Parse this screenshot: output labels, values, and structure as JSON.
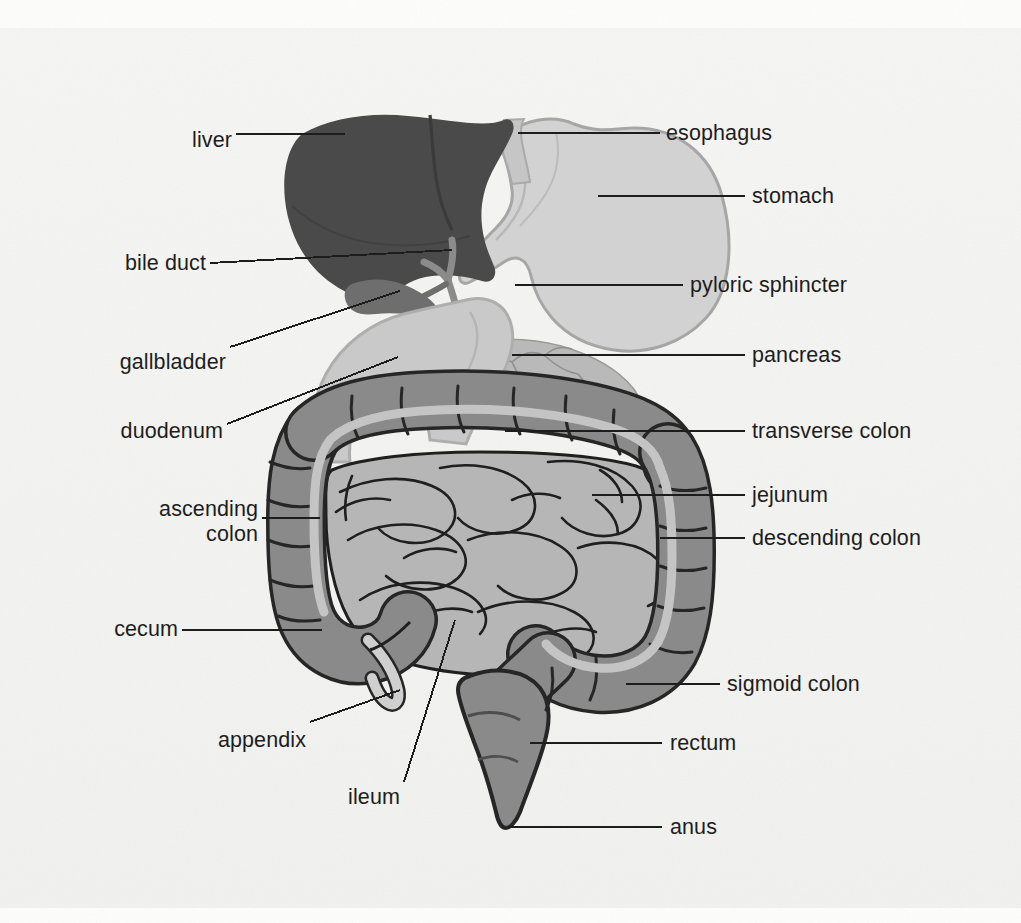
{
  "figure": {
    "kind": "labeled-anatomical-diagram",
    "background_color": "#f2f2f0"
  },
  "palette": {
    "liver": "#4a4a4a",
    "gallbladder": "#6e6e6e",
    "stomach": "#d2d2d2",
    "stomach_outline": "#a6a6a6",
    "duodenum": "#c9c9c9",
    "pancreas": "#b9b9b9",
    "colon": "#8a8a8a",
    "colon_stripe": "#c4c4c4",
    "colon_outline": "#262626",
    "small_intestine": "#b6b6b6",
    "small_intestine_outline": "#1f1f1f",
    "appendix": "#cfcfcf",
    "leader_line": "#1d1d1d",
    "text": "#1d1d1d"
  },
  "labels": {
    "left": [
      {
        "id": "liver",
        "text": "liver",
        "x": 172,
        "y": 128,
        "align": "right"
      },
      {
        "id": "bile-duct",
        "text": "bile duct",
        "x": 100,
        "y": 251,
        "align": "right"
      },
      {
        "id": "gallbladder",
        "text": "gallbladder",
        "x": 100,
        "y": 350,
        "align": "right"
      },
      {
        "id": "duodenum",
        "text": "duodenum",
        "x": 100,
        "y": 419,
        "align": "right"
      },
      {
        "id": "ascending-colon",
        "text": "ascending\ncolon",
        "x": 106,
        "y": 497,
        "align": "right"
      },
      {
        "id": "cecum",
        "text": "cecum",
        "x": 103,
        "y": 617,
        "align": "right"
      },
      {
        "id": "appendix",
        "text": "appendix",
        "x": 200,
        "y": 728,
        "align": "right"
      },
      {
        "id": "ileum",
        "text": "ileum",
        "x": 348,
        "y": 785,
        "align": "right"
      }
    ],
    "right": [
      {
        "id": "esophagus",
        "text": "esophagus",
        "x": 666,
        "y": 124,
        "align": "left"
      },
      {
        "id": "stomach",
        "text": "stomach",
        "x": 752,
        "y": 182,
        "align": "left"
      },
      {
        "id": "pyloric-sphincter",
        "text": "pyloric sphincter",
        "x": 690,
        "y": 271,
        "align": "left"
      },
      {
        "id": "pancreas",
        "text": "pancreas",
        "x": 752,
        "y": 337,
        "align": "left"
      },
      {
        "id": "transverse-colon",
        "text": "transverse colon",
        "x": 752,
        "y": 417,
        "align": "left"
      },
      {
        "id": "jejunum",
        "text": "jejunum",
        "x": 752,
        "y": 481,
        "align": "left"
      },
      {
        "id": "descending-colon",
        "text": "descending colon",
        "x": 752,
        "y": 524,
        "align": "left"
      },
      {
        "id": "sigmoid-colon",
        "text": "sigmoid colon",
        "x": 727,
        "y": 671,
        "align": "left"
      },
      {
        "id": "rectum",
        "text": "rectum",
        "x": 670,
        "y": 729,
        "align": "left"
      },
      {
        "id": "anus",
        "text": "anus",
        "x": 670,
        "y": 812,
        "align": "left"
      }
    ]
  },
  "organs": [
    {
      "id": "liver",
      "name": "liver"
    },
    {
      "id": "gallbladder",
      "name": "gallbladder"
    },
    {
      "id": "bile-duct",
      "name": "bile duct"
    },
    {
      "id": "esophagus",
      "name": "esophagus"
    },
    {
      "id": "stomach",
      "name": "stomach"
    },
    {
      "id": "pyloric-sphincter",
      "name": "pyloric sphincter"
    },
    {
      "id": "duodenum",
      "name": "duodenum"
    },
    {
      "id": "pancreas",
      "name": "pancreas"
    },
    {
      "id": "jejunum",
      "name": "jejunum"
    },
    {
      "id": "ileum",
      "name": "ileum"
    },
    {
      "id": "cecum",
      "name": "cecum"
    },
    {
      "id": "appendix",
      "name": "appendix"
    },
    {
      "id": "ascending-colon",
      "name": "ascending colon"
    },
    {
      "id": "transverse-colon",
      "name": "transverse colon"
    },
    {
      "id": "descending-colon",
      "name": "descending colon"
    },
    {
      "id": "sigmoid-colon",
      "name": "sigmoid colon"
    },
    {
      "id": "rectum",
      "name": "rectum"
    },
    {
      "id": "anus",
      "name": "anus"
    }
  ]
}
